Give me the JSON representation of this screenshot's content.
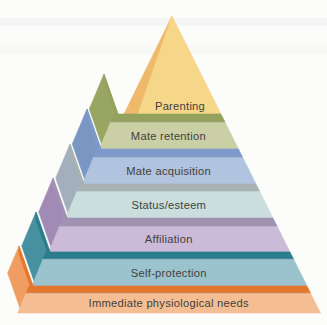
{
  "figure": {
    "kind": "pyramid-diagram",
    "background": "#fcfcfb",
    "scan_streak_colors": [
      "#f0f1f0",
      "#f4f4f3"
    ],
    "label_color": "#433f3e"
  },
  "chart_data": {
    "type": "pyramid",
    "title": "",
    "description_visible_text_only": "Seven-level 3D pyramid, top to bottom",
    "tiers_top_to_bottom": [
      {
        "label": "Parenting",
        "face": "#f6d789",
        "side": "#efb96c",
        "band": null
      },
      {
        "label": "Mate retention",
        "face": "#cbcfa5",
        "side": "#99a562",
        "band": "#95a25e"
      },
      {
        "label": "Mate acquisition",
        "face": "#b0c3df",
        "side": "#7a96c2",
        "band": "#7e9aca"
      },
      {
        "label": "Status/esteem",
        "face": "#cadedd",
        "side": "#a3afbd",
        "band": "#a9b2b0"
      },
      {
        "label": "Affiliation",
        "face": "#cbbad8",
        "side": "#a18ab6",
        "band": "#a092b1"
      },
      {
        "label": "Self-protection",
        "face": "#9ac3ce",
        "side": "#4790a0",
        "band": "#2a7d8c"
      },
      {
        "label": "Immediate physiological needs",
        "face": "#f5be92",
        "side": "#ef9d60",
        "band": "#e5762d"
      }
    ]
  }
}
